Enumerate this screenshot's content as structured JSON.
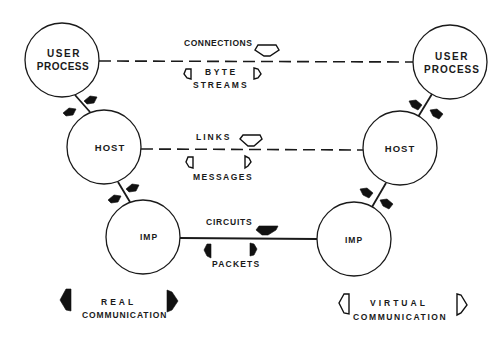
{
  "diagram": {
    "type": "layered network communication model",
    "nodes": {
      "user_left": {
        "label_line1": "USER",
        "label_line2": "PROCESS",
        "cx": 62,
        "cy": 60,
        "r": 37
      },
      "user_right": {
        "label_line1": "USER",
        "label_line2": "PROCESS",
        "cx": 450,
        "cy": 62,
        "r": 37
      },
      "host_left": {
        "label": "HOST",
        "cx": 104,
        "cy": 147,
        "r": 37
      },
      "host_right": {
        "label": "HOST",
        "cx": 400,
        "cy": 148,
        "r": 37
      },
      "imp_left": {
        "label": "IMP",
        "cx": 143,
        "cy": 237,
        "r": 37
      },
      "imp_right": {
        "label": "IMP",
        "cx": 354,
        "cy": 239,
        "r": 37
      }
    },
    "layers": {
      "top": {
        "upper_label": "CONNECTIONS",
        "lower_label_line1": "BYTE",
        "lower_label_line2": "STREAMS",
        "style": "dashed",
        "arrow_kind": "virtual"
      },
      "middle": {
        "upper_label": "LINKS",
        "lower_label": "MESSAGES",
        "style": "dashed",
        "arrow_kind": "virtual"
      },
      "bottom": {
        "upper_label": "CIRCUITS",
        "lower_label": "PACKETS",
        "style": "solid",
        "arrow_kind": "real"
      }
    },
    "legend": {
      "real": {
        "line1": "REAL",
        "line2": "COMMUNICATION",
        "arrow_style": "filled"
      },
      "virtual": {
        "line1": "VIRTUAL",
        "line2": "COMMUNICATION",
        "arrow_style": "outline"
      }
    },
    "colors": {
      "ink": "#1a1a1a",
      "background": "#ffffff"
    }
  }
}
